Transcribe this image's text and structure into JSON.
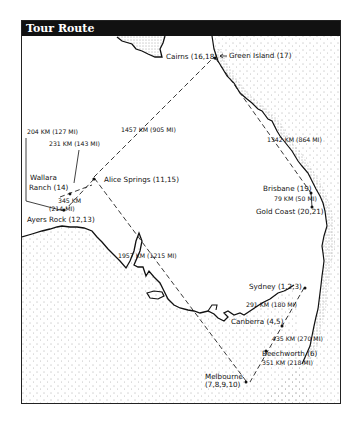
{
  "title": "Tour Route",
  "map": {
    "stops": [
      {
        "name": "Cairns",
        "days": "16,18",
        "label": "Cairns (16,18)"
      },
      {
        "name": "Green Island",
        "days": "17",
        "label": "Green Island (17)"
      },
      {
        "name": "Brisbane",
        "days": "19",
        "label": "Brisbane (19)"
      },
      {
        "name": "Gold Coast",
        "days": "20,21",
        "label": "Gold Coast (20,21)"
      },
      {
        "name": "Sydney",
        "days": "1,2,3",
        "label": "Sydney (1,2,3)"
      },
      {
        "name": "Canberra",
        "days": "4,5",
        "label": "Canberra (4,5)"
      },
      {
        "name": "Beechworth",
        "days": "6",
        "label": "Beechworth (6)"
      },
      {
        "name": "Melbourne",
        "days": "7,8,9,10",
        "label_line1": "Melbourne",
        "label_line2": "(7,8,9,10)"
      },
      {
        "name": "Alice Springs",
        "days": "11,15",
        "label": "Alice Springs (11,15)"
      },
      {
        "name": "Ayers Rock",
        "days": "12,13",
        "label": "Ayers Rock (12,13)"
      },
      {
        "name": "Wallara Ranch",
        "days": "14",
        "label_line1": "Wallara",
        "label_line2": "Ranch (14)"
      }
    ],
    "legs": [
      {
        "from": "Alice Springs",
        "to": "Cairns",
        "label": "1457 KM (905 MI)"
      },
      {
        "from": "Cairns",
        "to": "Brisbane",
        "label": "1342 KM (864 MI)"
      },
      {
        "from": "Brisbane",
        "to": "Gold Coast",
        "label": "79 KM (50 MI)"
      },
      {
        "from": "Sydney",
        "to": "Canberra",
        "label": "291 KM (180 MI)"
      },
      {
        "from": "Canberra",
        "to": "Beechworth",
        "label": "435 KM (270 MI)"
      },
      {
        "from": "Beechworth",
        "to": "Melbourne",
        "label": "351 KM (218 MI)"
      },
      {
        "from": "Melbourne",
        "to": "Alice Springs",
        "label": "1957 KM (1215 MI)"
      },
      {
        "from": "Alice Springs",
        "to": "Ayers Rock",
        "label_line1": "345 KM",
        "label_line2": "(214 MI)"
      },
      {
        "from": "Ayers Rock",
        "to": "Wallara Ranch",
        "label": "204 KM (127 MI)"
      },
      {
        "from": "Wallara Ranch",
        "to": "Alice Springs",
        "label": "231 KM (143 MI)"
      }
    ]
  }
}
